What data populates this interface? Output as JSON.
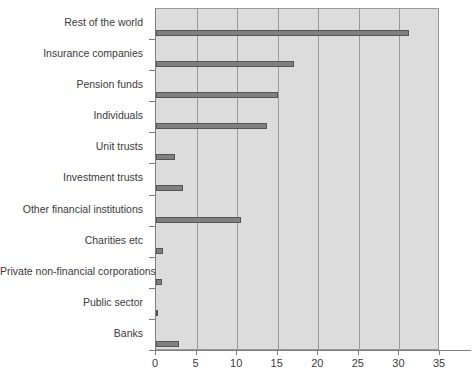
{
  "chart_data": {
    "type": "bar",
    "orientation": "horizontal",
    "title": "",
    "xlabel": "",
    "ylabel": "",
    "xlim": [
      0,
      35
    ],
    "xticks": [
      0,
      5,
      10,
      15,
      20,
      25,
      30,
      35
    ],
    "grid": "vertical",
    "legend": "none",
    "bar_color": "#808080",
    "bar_edge_color": "#555555",
    "plot_background": "#dcdcdc",
    "axis_color": "#7d7d7d",
    "categories": [
      "Rest of the world",
      "Insurance companies",
      "Pension funds",
      "Individuals",
      "Unit trusts",
      "Investment trusts",
      "Other financial institutions",
      "Charities etc",
      "Private non-financial corporations",
      "Public sector",
      "Banks"
    ],
    "values": [
      31.2,
      17.0,
      15.0,
      13.7,
      2.3,
      3.3,
      10.5,
      0.9,
      0.7,
      0.2,
      2.8
    ]
  }
}
